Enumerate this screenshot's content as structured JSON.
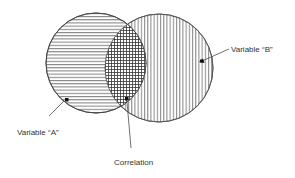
{
  "diagram": {
    "type": "venn",
    "sets": [
      {
        "id": "A",
        "label": "Variable “A”",
        "hatch": "horizontal"
      },
      {
        "id": "B",
        "label": "Variable “B”",
        "hatch": "vertical"
      }
    ],
    "intersection": {
      "label": "Correlation",
      "hatch": "crosshatch"
    },
    "colors": {
      "stroke": "#444444",
      "background": "#ffffff",
      "text": "#333333"
    }
  },
  "labels": {
    "variable_a": "Variable “A”",
    "variable_b": "Variable “B”",
    "correlation": "Correlation"
  }
}
